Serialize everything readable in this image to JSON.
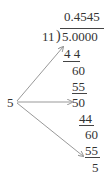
{
  "division": {
    "quotient": "0.4545",
    "divisor": "11",
    "dividend": "5.0000",
    "steps": [
      "4 4",
      "60",
      "55",
      "50",
      "44",
      "60",
      "55",
      "5"
    ]
  },
  "remainder_label": "5",
  "colors": {
    "text": "#333333",
    "arrow": "#999999"
  }
}
